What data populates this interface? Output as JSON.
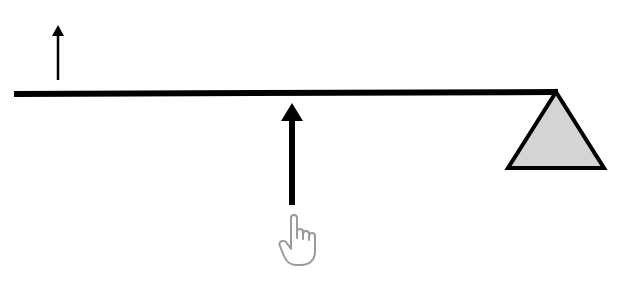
{
  "diagram": {
    "colors": {
      "line": "#000000",
      "fulcrum_fill": "#d4d4d4",
      "hand_stroke": "#9a9a9a",
      "background": "#ffffff"
    },
    "elements": [
      {
        "name": "lever-bar",
        "type": "line"
      },
      {
        "name": "load-arrow",
        "type": "arrow",
        "direction": "up",
        "size": "small"
      },
      {
        "name": "effort-arrow",
        "type": "arrow",
        "direction": "up",
        "size": "large"
      },
      {
        "name": "fulcrum",
        "type": "triangle"
      },
      {
        "name": "hand-pointer-icon",
        "type": "icon"
      }
    ]
  }
}
